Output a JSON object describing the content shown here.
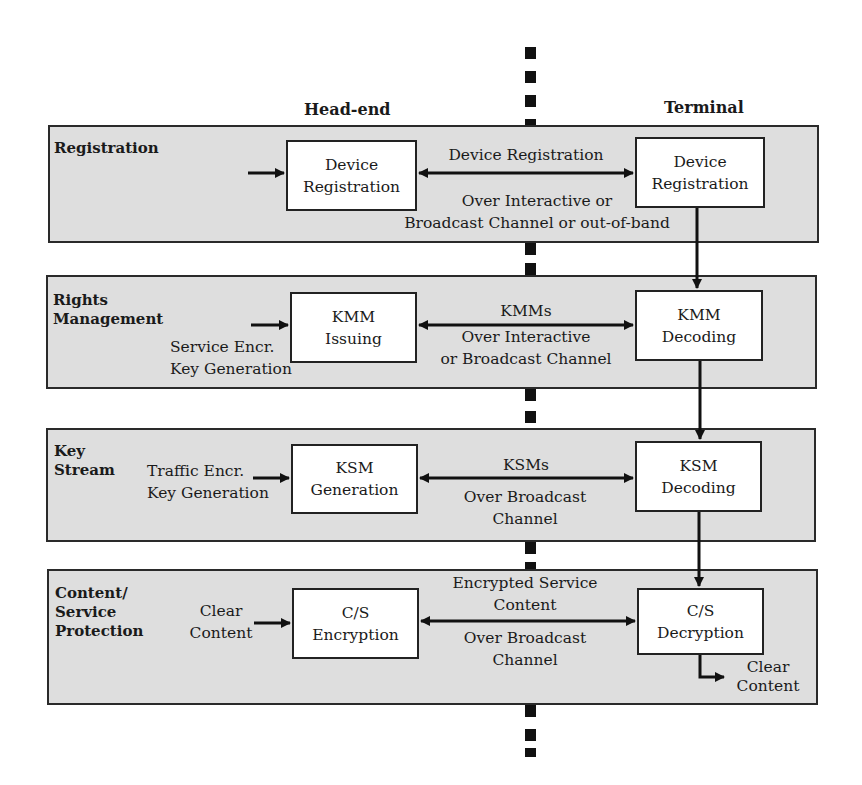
{
  "columns": {
    "head_end": "Head-end",
    "terminal": "Terminal"
  },
  "bands": [
    {
      "title": "Registration",
      "head_end_box": [
        "Device",
        "Registration"
      ],
      "terminal_box": [
        "Device",
        "Registration"
      ],
      "input_label": [],
      "channel_top": [
        "Device Registration"
      ],
      "channel_bottom": [
        "Over Interactive or",
        "Broadcast Channel or out-of-band"
      ]
    },
    {
      "title": "Rights Management",
      "title_lines": [
        "Rights",
        "Management"
      ],
      "head_end_box": [
        "KMM",
        "Issuing"
      ],
      "terminal_box": [
        "KMM",
        "Decoding"
      ],
      "input_label": [
        "Service Encr.",
        "Key Generation"
      ],
      "channel_top": [
        "KMMs"
      ],
      "channel_bottom": [
        "Over Interactive",
        "or Broadcast Channel"
      ]
    },
    {
      "title": "Key Stream",
      "title_lines": [
        "Key",
        "Stream"
      ],
      "head_end_box": [
        "KSM",
        "Generation"
      ],
      "terminal_box": [
        "KSM",
        "Decoding"
      ],
      "input_label": [
        "Traffic Encr.",
        "Key Generation"
      ],
      "channel_top": [
        "KSMs"
      ],
      "channel_bottom": [
        "Over Broadcast",
        "Channel"
      ]
    },
    {
      "title": "Content/ Service Protection",
      "title_lines": [
        "Content/",
        "Service",
        "Protection"
      ],
      "head_end_box": [
        "C/S",
        "Encryption"
      ],
      "terminal_box": [
        "C/S",
        "Decryption"
      ],
      "input_label": [
        "Clear",
        "Content"
      ],
      "channel_top": [
        "Encrypted Service",
        "Content"
      ],
      "channel_bottom": [
        "Over Broadcast",
        "Channel"
      ],
      "output_label": [
        "Clear",
        "Content"
      ]
    }
  ],
  "colors": {
    "band_fill": "#dedede",
    "box_fill": "#ffffff",
    "line": "#111111"
  }
}
